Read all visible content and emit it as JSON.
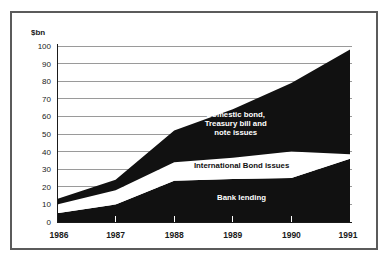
{
  "chart_data": {
    "type": "area",
    "title": "",
    "subtitle": "",
    "xlabel": "",
    "ylabel": "$bn",
    "unit_label": "$bn",
    "stacked": true,
    "grid": true,
    "legend_position": "inline",
    "categories": [
      "1986",
      "1987",
      "1988",
      "1989",
      "1990",
      "1991"
    ],
    "x": [
      1986,
      1987,
      1988,
      1989,
      1990,
      1991
    ],
    "xlim": [
      1986,
      1991
    ],
    "ylim": [
      0,
      100
    ],
    "ytick_labels": [
      "0",
      "10",
      "20",
      "30",
      "40",
      "50",
      "60",
      "70",
      "80",
      "90",
      "100"
    ],
    "yticks": [
      0,
      10,
      20,
      30,
      40,
      50,
      60,
      70,
      80,
      90,
      100
    ],
    "ytick_step": 10,
    "xtick_labels": [
      "1986",
      "1987",
      "1988",
      "1989",
      "1990",
      "1991"
    ],
    "series": [
      {
        "name": "Bank lending",
        "label": "Bank lending",
        "color": "#111111",
        "label_color": "#ffffff",
        "values": [
          5,
          10,
          23.5,
          24.5,
          25,
          36
        ],
        "cumulative": [
          5,
          10,
          23.5,
          24.5,
          25,
          36
        ]
      },
      {
        "name": "International Bond issues",
        "label": "International Bond issues",
        "color": "#ffffff",
        "label_color": "#111111",
        "values": [
          5,
          8,
          10.5,
          12,
          15,
          2.5
        ],
        "cumulative": [
          10,
          18,
          34,
          36.5,
          40,
          38.5
        ]
      },
      {
        "name": "Domestic bond, Treasury bill and note issues",
        "label": "Domestic bond, Treasury bill and note issues",
        "label_lines": [
          "Domestic bond,",
          "Treasury bill and",
          "note issues"
        ],
        "color": "#111111",
        "label_color": "#ffffff",
        "values": [
          3,
          6,
          18,
          27.5,
          39,
          59.5
        ],
        "cumulative": [
          13,
          24,
          52,
          64,
          79,
          98
        ]
      }
    ],
    "annotations": [
      {
        "text": "Domestic bond,",
        "x": 1989.05,
        "y": 59.5
      },
      {
        "text": "Treasury bill and",
        "x": 1989.05,
        "y": 54.5
      },
      {
        "text": "note issues",
        "x": 1989.05,
        "y": 49.5
      },
      {
        "text": "International Bond issues",
        "x": 1989.15,
        "y": 30.5
      },
      {
        "text": "Bank lending",
        "x": 1989.15,
        "y": 12.5
      }
    ]
  },
  "colors": {
    "frame_border": "#5b5b5b",
    "background": "#ffffff",
    "gridline": "#9a9a9a",
    "ink": "#111111",
    "text": "#1a1a1a"
  }
}
